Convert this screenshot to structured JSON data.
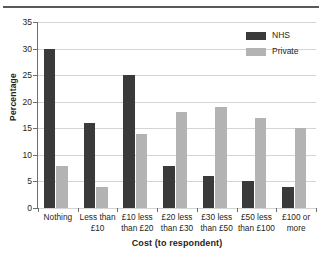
{
  "chart_data": {
    "type": "bar",
    "title": "",
    "xlabel": "Cost (to respondent)",
    "ylabel": "Percentage",
    "ylim": [
      0,
      35
    ],
    "yticks": [
      0,
      5,
      10,
      15,
      20,
      25,
      30,
      35
    ],
    "grid": true,
    "legend_position": "top-right",
    "categories": [
      "Nothing",
      "Less than £10",
      "£10 less than £20",
      "£20 less than £30",
      "£30 less than £50",
      "£50 less than £100",
      "£100 or more"
    ],
    "category_lines": [
      [
        "Nothing"
      ],
      [
        "Less than",
        "£10"
      ],
      [
        "£10 less",
        "than £20"
      ],
      [
        "£20 less",
        "than £30"
      ],
      [
        "£30 less",
        "than £50"
      ],
      [
        "£50 less",
        "than £100"
      ],
      [
        "£100 or",
        "more"
      ]
    ],
    "series": [
      {
        "name": "NHS",
        "color": "#3a3a3a",
        "values": [
          30,
          16,
          25,
          8,
          6,
          5,
          4
        ]
      },
      {
        "name": "Private",
        "color": "#b3b3b3",
        "values": [
          8,
          4,
          14,
          18,
          19,
          17,
          15
        ]
      }
    ]
  },
  "legend": {
    "items": [
      {
        "label": "NHS",
        "color": "#3a3a3a"
      },
      {
        "label": "Private",
        "color": "#b3b3b3"
      }
    ]
  }
}
